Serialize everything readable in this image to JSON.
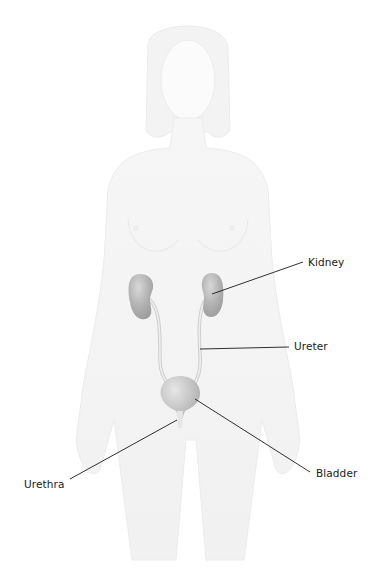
{
  "diagram": {
    "labels": [
      {
        "id": "kidney",
        "text": "Kidney",
        "x": 308,
        "y": 257,
        "pointer": {
          "from": [
            303,
            262
          ],
          "to": [
            212,
            294
          ]
        }
      },
      {
        "id": "ureter",
        "text": "Ureter",
        "x": 294,
        "y": 339,
        "pointer": {
          "from": [
            289,
            345
          ],
          "to": [
            200,
            349
          ]
        }
      },
      {
        "id": "bladder",
        "text": "Bladder",
        "x": 316,
        "y": 469,
        "pointer": {
          "from": [
            310,
            472
          ],
          "to": [
            195,
            399
          ]
        }
      },
      {
        "id": "urethra",
        "text": "Urethra",
        "x": 24,
        "y": 480,
        "pointer": {
          "from": [
            70,
            479
          ],
          "to": [
            177,
            420
          ]
        }
      }
    ],
    "colors": {
      "organ": "#a9a9a9",
      "organ_highlight": "#d6d6d6",
      "body_silhouette": "#f2f2f2",
      "leader_line": "#1a1a1a",
      "label_text": "#1a1a1a"
    }
  }
}
